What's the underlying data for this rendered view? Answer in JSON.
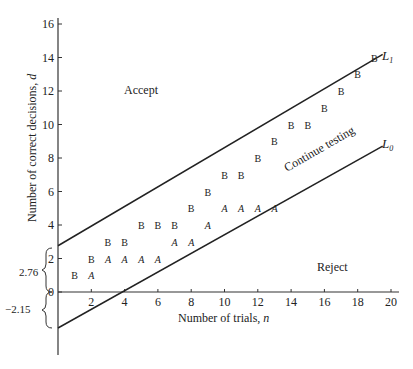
{
  "chart_data": {
    "type": "scatter",
    "title": "",
    "xlabel": "Number of trials, n",
    "ylabel": "Number of correct decisions, d",
    "xlim": [
      0,
      20
    ],
    "ylim": [
      -3.5,
      16.5
    ],
    "x_ticks": [
      2,
      4,
      6,
      8,
      10,
      12,
      14,
      16,
      18,
      20
    ],
    "y_ticks": [
      0,
      2,
      4,
      6,
      8,
      10,
      12,
      14,
      16
    ],
    "grid": false,
    "region_labels": [
      "Accept",
      "Continue testing",
      "Reject"
    ],
    "lines": [
      {
        "name": "L1",
        "intercept": 2.76,
        "slope": 0.586
      },
      {
        "name": "L0",
        "intercept": -2.15,
        "slope": 0.557
      }
    ],
    "intercept_annotations": [
      {
        "label": "2.76",
        "from": 0,
        "to": 2.76
      },
      {
        "label": "−2.15",
        "from": -2.15,
        "to": 0
      }
    ],
    "series": [
      {
        "name": "A",
        "points": [
          [
            2,
            1
          ],
          [
            3,
            2
          ],
          [
            4,
            2
          ],
          [
            5,
            2
          ],
          [
            6,
            2
          ],
          [
            7,
            3
          ],
          [
            8,
            3
          ],
          [
            9,
            4
          ],
          [
            10,
            5
          ],
          [
            11,
            5
          ],
          [
            12,
            5
          ],
          [
            13,
            5
          ]
        ]
      },
      {
        "name": "B",
        "points": [
          [
            1,
            1
          ],
          [
            2,
            2
          ],
          [
            3,
            3
          ],
          [
            4,
            3
          ],
          [
            5,
            4
          ],
          [
            6,
            4
          ],
          [
            7,
            4
          ],
          [
            8,
            5
          ],
          [
            9,
            6
          ],
          [
            10,
            7
          ],
          [
            11,
            7
          ],
          [
            12,
            8
          ],
          [
            13,
            9
          ],
          [
            14,
            10
          ],
          [
            15,
            10
          ],
          [
            16,
            11
          ],
          [
            17,
            12
          ],
          [
            18,
            13
          ],
          [
            19,
            14
          ]
        ]
      }
    ]
  },
  "labels": {
    "accept": "Accept",
    "reject": "Reject",
    "continue": "Continue testing",
    "l1": "L",
    "l1_sub": "1",
    "l0": "L",
    "l0_sub": "0",
    "xlabel_text": "Number of trials, ",
    "xlabel_var": "n",
    "ylabel_text": "Number of correct decisions, ",
    "ylabel_var": "d",
    "brace_upper": "2.76",
    "brace_lower": "−2.15"
  }
}
